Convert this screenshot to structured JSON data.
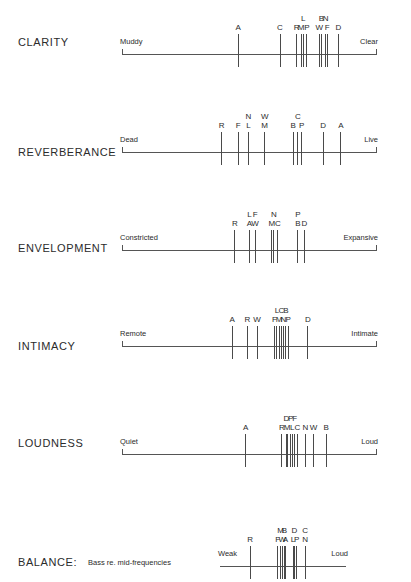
{
  "figure": {
    "background_color": "#ffffff",
    "line_color": "#555555",
    "text_color": "#2b2b2b"
  },
  "chart_data": {
    "type": "scatter",
    "xlabel": "",
    "ylabel": "",
    "grid": false,
    "legend_position": "none",
    "note": "Each row is a bipolar rating scale; vertical ticks mark individual concert halls identified by letter codes. x is the normalized position along the scale from 0 (left anchor) to 1 (right anchor).",
    "axes": [
      {
        "name": "CLARITY",
        "left_anchor": "Muddy",
        "right_anchor": "Clear",
        "marks": [
          {
            "letter": "A",
            "x": 0.455,
            "tier": 0
          },
          {
            "letter": "C",
            "x": 0.62,
            "tier": 0
          },
          {
            "letter": "R",
            "x": 0.686,
            "tier": 0
          },
          {
            "letter": "M",
            "x": 0.703,
            "tier": 0
          },
          {
            "letter": "L",
            "x": 0.712,
            "tier": 1
          },
          {
            "letter": "P",
            "x": 0.726,
            "tier": 0
          },
          {
            "letter": "W",
            "x": 0.775,
            "tier": 0
          },
          {
            "letter": "B",
            "x": 0.783,
            "tier": 1
          },
          {
            "letter": "N",
            "x": 0.8,
            "tier": 1
          },
          {
            "letter": "F",
            "x": 0.806,
            "tier": 0
          },
          {
            "letter": "D",
            "x": 0.85,
            "tier": 0
          }
        ]
      },
      {
        "name": "REVERBERANCE",
        "left_anchor": "Dead",
        "right_anchor": "Live",
        "marks": [
          {
            "letter": "R",
            "x": 0.39,
            "tier": 0
          },
          {
            "letter": "F",
            "x": 0.455,
            "tier": 0
          },
          {
            "letter": "L",
            "x": 0.496,
            "tier": 0
          },
          {
            "letter": "N",
            "x": 0.496,
            "tier": 1
          },
          {
            "letter": "M",
            "x": 0.56,
            "tier": 0
          },
          {
            "letter": "W",
            "x": 0.56,
            "tier": 1
          },
          {
            "letter": "B",
            "x": 0.672,
            "tier": 0
          },
          {
            "letter": "C",
            "x": 0.69,
            "tier": 1
          },
          {
            "letter": "P",
            "x": 0.705,
            "tier": 0
          },
          {
            "letter": "D",
            "x": 0.79,
            "tier": 0
          },
          {
            "letter": "A",
            "x": 0.86,
            "tier": 0
          }
        ]
      },
      {
        "name": "ENVELOPMENT",
        "left_anchor": "Constricted",
        "right_anchor": "Expansive",
        "marks": [
          {
            "letter": "R",
            "x": 0.442,
            "tier": 0
          },
          {
            "letter": "A",
            "x": 0.5,
            "tier": 0
          },
          {
            "letter": "L",
            "x": 0.5,
            "tier": 1
          },
          {
            "letter": "W",
            "x": 0.522,
            "tier": 0
          },
          {
            "letter": "F",
            "x": 0.522,
            "tier": 1
          },
          {
            "letter": "M",
            "x": 0.588,
            "tier": 0
          },
          {
            "letter": "N",
            "x": 0.596,
            "tier": 1
          },
          {
            "letter": "C",
            "x": 0.612,
            "tier": 0
          },
          {
            "letter": "B",
            "x": 0.69,
            "tier": 0
          },
          {
            "letter": "P",
            "x": 0.69,
            "tier": 1
          },
          {
            "letter": "D",
            "x": 0.716,
            "tier": 0
          }
        ]
      },
      {
        "name": "INTIMACY",
        "left_anchor": "Remote",
        "right_anchor": "Intimate",
        "marks": [
          {
            "letter": "A",
            "x": 0.432,
            "tier": 0
          },
          {
            "letter": "R",
            "x": 0.492,
            "tier": 0
          },
          {
            "letter": "W",
            "x": 0.53,
            "tier": 0
          },
          {
            "letter": "F",
            "x": 0.598,
            "tier": 0
          },
          {
            "letter": "L",
            "x": 0.608,
            "tier": 1
          },
          {
            "letter": "M",
            "x": 0.616,
            "tier": 0
          },
          {
            "letter": "C",
            "x": 0.626,
            "tier": 1
          },
          {
            "letter": "N",
            "x": 0.634,
            "tier": 0
          },
          {
            "letter": "B",
            "x": 0.643,
            "tier": 1
          },
          {
            "letter": "P",
            "x": 0.652,
            "tier": 0
          },
          {
            "letter": "D",
            "x": 0.73,
            "tier": 0
          }
        ]
      },
      {
        "name": "LOUDNESS",
        "left_anchor": "Quiet",
        "right_anchor": "Loud",
        "marks": [
          {
            "letter": "A",
            "x": 0.485,
            "tier": 0
          },
          {
            "letter": "R",
            "x": 0.627,
            "tier": 0
          },
          {
            "letter": "D",
            "x": 0.645,
            "tier": 1
          },
          {
            "letter": "M",
            "x": 0.648,
            "tier": 0
          },
          {
            "letter": "P",
            "x": 0.662,
            "tier": 1
          },
          {
            "letter": "L",
            "x": 0.668,
            "tier": 0
          },
          {
            "letter": "F",
            "x": 0.678,
            "tier": 1
          },
          {
            "letter": "C",
            "x": 0.688,
            "tier": 0
          },
          {
            "letter": "N",
            "x": 0.72,
            "tier": 0
          },
          {
            "letter": "W",
            "x": 0.752,
            "tier": 0
          },
          {
            "letter": "B",
            "x": 0.802,
            "tier": 0
          }
        ]
      },
      {
        "name": "BALANCE:",
        "sub_label": "Bass re. mid-frequencies",
        "left_anchor": "Weak",
        "right_anchor": "Loud",
        "marks": [
          {
            "letter": "R",
            "x": 0.235,
            "tier": 0
          },
          {
            "letter": "F",
            "x": 0.455,
            "tier": 0
          },
          {
            "letter": "M",
            "x": 0.478,
            "tier": 1
          },
          {
            "letter": "W",
            "x": 0.49,
            "tier": 0
          },
          {
            "letter": "B",
            "x": 0.508,
            "tier": 1
          },
          {
            "letter": "A",
            "x": 0.516,
            "tier": 0
          },
          {
            "letter": "L",
            "x": 0.576,
            "tier": 0
          },
          {
            "letter": "D",
            "x": 0.586,
            "tier": 1
          },
          {
            "letter": "P",
            "x": 0.604,
            "tier": 0
          },
          {
            "letter": "C",
            "x": 0.672,
            "tier": 1
          },
          {
            "letter": "N",
            "x": 0.672,
            "tier": 0
          }
        ]
      }
    ]
  },
  "rows": [
    {
      "name": "CLARITY",
      "label": "CLARITY",
      "sub_label": "",
      "left_anchor": "Muddy",
      "right_anchor": "Clear",
      "top": 10,
      "label_top": 36,
      "axis_top": 54,
      "axis_left": 122,
      "axis_width": 254,
      "has_end_caps": true,
      "ticks": [
        {
          "letter": "A",
          "x": 0.455,
          "tier": 0
        },
        {
          "letter": "C",
          "x": 0.62,
          "tier": 0
        },
        {
          "letter": "R",
          "x": 0.686,
          "tier": 0
        },
        {
          "letter": "M",
          "x": 0.703,
          "tier": 0
        },
        {
          "letter": "L",
          "x": 0.712,
          "tier": 1
        },
        {
          "letter": "P",
          "x": 0.726,
          "tier": 0
        },
        {
          "letter": "W",
          "x": 0.775,
          "tier": 0
        },
        {
          "letter": "B",
          "x": 0.783,
          "tier": 1
        },
        {
          "letter": "N",
          "x": 0.8,
          "tier": 1
        },
        {
          "letter": "F",
          "x": 0.806,
          "tier": 0
        },
        {
          "letter": "D",
          "x": 0.85,
          "tier": 0
        }
      ]
    },
    {
      "name": "REVERBERANCE",
      "label": "REVERBERANCE",
      "sub_label": "",
      "left_anchor": "Dead",
      "right_anchor": "Live",
      "top": 105,
      "label_top": 146,
      "axis_top": 152,
      "axis_left": 122,
      "axis_width": 254,
      "has_end_caps": true,
      "ticks": [
        {
          "letter": "R",
          "x": 0.39,
          "tier": 0
        },
        {
          "letter": "F",
          "x": 0.455,
          "tier": 0
        },
        {
          "letter": "L",
          "x": 0.496,
          "tier": 0
        },
        {
          "letter": "N",
          "x": 0.496,
          "tier": 1
        },
        {
          "letter": "M",
          "x": 0.56,
          "tier": 0
        },
        {
          "letter": "W",
          "x": 0.56,
          "tier": 1
        },
        {
          "letter": "B",
          "x": 0.672,
          "tier": 0
        },
        {
          "letter": "C",
          "x": 0.69,
          "tier": 1
        },
        {
          "letter": "P",
          "x": 0.705,
          "tier": 0
        },
        {
          "letter": "D",
          "x": 0.79,
          "tier": 0
        },
        {
          "letter": "A",
          "x": 0.86,
          "tier": 0
        }
      ]
    },
    {
      "name": "ENVELOPMENT",
      "label": "ENVELOPMENT",
      "sub_label": "",
      "left_anchor": "Constricted",
      "right_anchor": "Expansive",
      "top": 200,
      "label_top": 242,
      "axis_top": 250,
      "axis_left": 122,
      "axis_width": 254,
      "has_end_caps": true,
      "ticks": [
        {
          "letter": "R",
          "x": 0.442,
          "tier": 0
        },
        {
          "letter": "A",
          "x": 0.5,
          "tier": 0
        },
        {
          "letter": "L",
          "x": 0.5,
          "tier": 1
        },
        {
          "letter": "W",
          "x": 0.522,
          "tier": 0
        },
        {
          "letter": "F",
          "x": 0.522,
          "tier": 1
        },
        {
          "letter": "M",
          "x": 0.588,
          "tier": 0
        },
        {
          "letter": "N",
          "x": 0.596,
          "tier": 1
        },
        {
          "letter": "C",
          "x": 0.612,
          "tier": 0
        },
        {
          "letter": "B",
          "x": 0.69,
          "tier": 0
        },
        {
          "letter": "P",
          "x": 0.69,
          "tier": 1
        },
        {
          "letter": "D",
          "x": 0.716,
          "tier": 0
        }
      ]
    },
    {
      "name": "INTIMACY",
      "label": "INTIMACY",
      "sub_label": "",
      "left_anchor": "Remote",
      "right_anchor": "Intimate",
      "top": 296,
      "label_top": 340,
      "axis_top": 346,
      "axis_left": 122,
      "axis_width": 254,
      "has_end_caps": true,
      "ticks": [
        {
          "letter": "A",
          "x": 0.432,
          "tier": 0
        },
        {
          "letter": "R",
          "x": 0.492,
          "tier": 0
        },
        {
          "letter": "W",
          "x": 0.53,
          "tier": 0
        },
        {
          "letter": "F",
          "x": 0.598,
          "tier": 0
        },
        {
          "letter": "L",
          "x": 0.608,
          "tier": 1
        },
        {
          "letter": "M",
          "x": 0.616,
          "tier": 0
        },
        {
          "letter": "C",
          "x": 0.626,
          "tier": 1
        },
        {
          "letter": "N",
          "x": 0.634,
          "tier": 0
        },
        {
          "letter": "B",
          "x": 0.643,
          "tier": 1
        },
        {
          "letter": "P",
          "x": 0.652,
          "tier": 0
        },
        {
          "letter": "D",
          "x": 0.73,
          "tier": 0
        }
      ]
    },
    {
      "name": "LOUDNESS",
      "label": "LOUDNESS",
      "sub_label": "",
      "left_anchor": "Quiet",
      "right_anchor": "Loud",
      "top": 393,
      "label_top": 437,
      "axis_top": 454,
      "axis_left": 122,
      "axis_width": 254,
      "has_end_caps": true,
      "ticks": [
        {
          "letter": "A",
          "x": 0.485,
          "tier": 0
        },
        {
          "letter": "R",
          "x": 0.627,
          "tier": 0
        },
        {
          "letter": "D",
          "x": 0.645,
          "tier": 1
        },
        {
          "letter": "M",
          "x": 0.648,
          "tier": 0
        },
        {
          "letter": "P",
          "x": 0.662,
          "tier": 1
        },
        {
          "letter": "L",
          "x": 0.668,
          "tier": 0
        },
        {
          "letter": "F",
          "x": 0.678,
          "tier": 1
        },
        {
          "letter": "C",
          "x": 0.688,
          "tier": 0
        },
        {
          "letter": "N",
          "x": 0.72,
          "tier": 0
        },
        {
          "letter": "W",
          "x": 0.752,
          "tier": 0
        },
        {
          "letter": "B",
          "x": 0.802,
          "tier": 0
        }
      ]
    },
    {
      "name": "BALANCE",
      "label": "BALANCE:",
      "sub_label": "Bass re. mid-frequencies",
      "left_anchor": "Weak",
      "right_anchor": "Loud",
      "top": 502,
      "label_top": 556,
      "axis_top": 566,
      "axis_left": 220,
      "axis_width": 126,
      "has_end_caps": false,
      "ticks": [
        {
          "letter": "R",
          "x": 0.235,
          "tier": 0
        },
        {
          "letter": "F",
          "x": 0.455,
          "tier": 0
        },
        {
          "letter": "M",
          "x": 0.478,
          "tier": 1
        },
        {
          "letter": "W",
          "x": 0.49,
          "tier": 0
        },
        {
          "letter": "B",
          "x": 0.508,
          "tier": 1
        },
        {
          "letter": "A",
          "x": 0.516,
          "tier": 0
        },
        {
          "letter": "L",
          "x": 0.576,
          "tier": 0
        },
        {
          "letter": "D",
          "x": 0.586,
          "tier": 1
        },
        {
          "letter": "P",
          "x": 0.604,
          "tier": 0
        },
        {
          "letter": "C",
          "x": 0.672,
          "tier": 1
        },
        {
          "letter": "N",
          "x": 0.672,
          "tier": 0
        }
      ]
    }
  ]
}
